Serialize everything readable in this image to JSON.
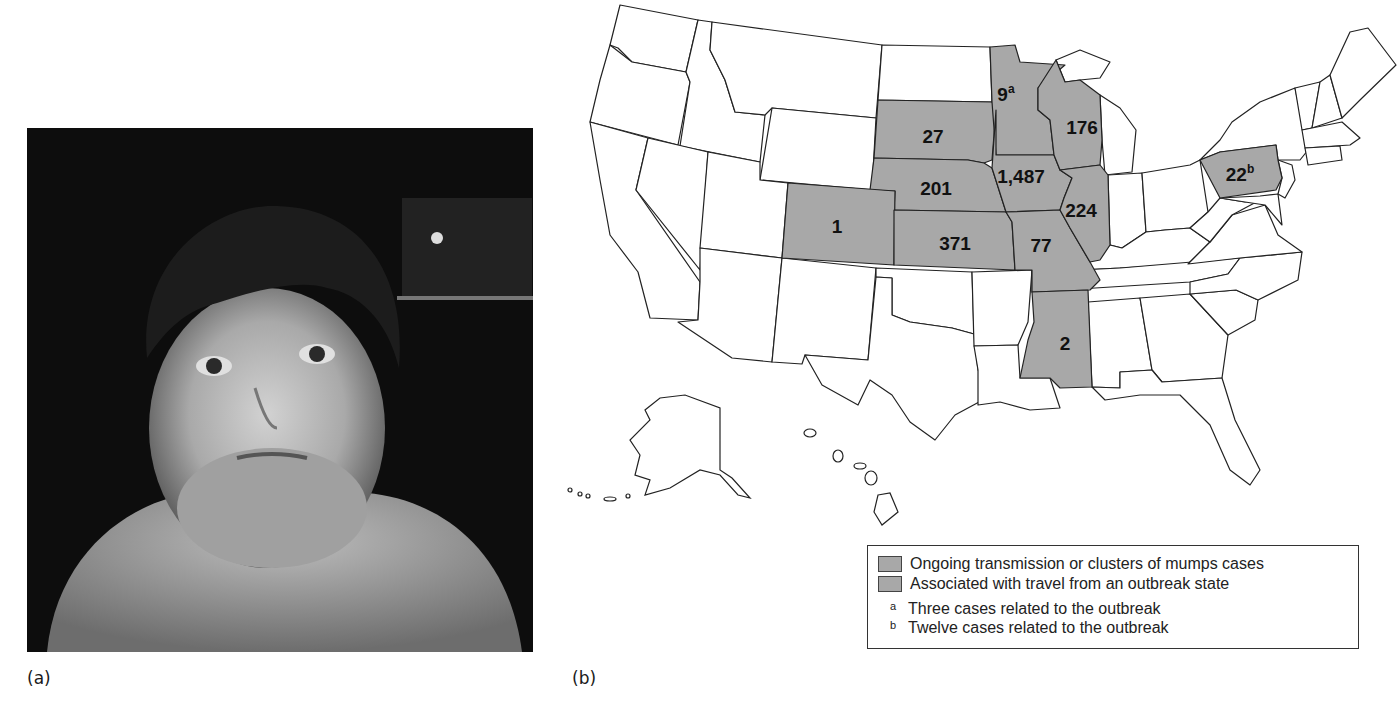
{
  "panels": {
    "a": {
      "label": "(a)",
      "image_desc": "Black-and-white photograph of a young child with swollen jaw/neck (mumps parotitis)"
    },
    "b": {
      "label": "(b)"
    }
  },
  "map": {
    "shade_color": "#a8a8a8",
    "states": [
      {
        "state": "South Dakota",
        "value": "27",
        "sup": ""
      },
      {
        "state": "Minnesota",
        "value": "9",
        "sup": "a"
      },
      {
        "state": "Wisconsin",
        "value": "176",
        "sup": ""
      },
      {
        "state": "Nebraska",
        "value": "201",
        "sup": ""
      },
      {
        "state": "Iowa",
        "value": "1,487",
        "sup": ""
      },
      {
        "state": "Illinois",
        "value": "224",
        "sup": ""
      },
      {
        "state": "Colorado",
        "value": "1",
        "sup": ""
      },
      {
        "state": "Kansas",
        "value": "371",
        "sup": ""
      },
      {
        "state": "Missouri",
        "value": "77",
        "sup": ""
      },
      {
        "state": "Pennsylvania",
        "value": "22",
        "sup": "b"
      },
      {
        "state": "Mississippi",
        "value": "2",
        "sup": ""
      }
    ]
  },
  "legend": {
    "items": [
      {
        "label": "Ongoing transmission or clusters of mumps cases"
      },
      {
        "label": "Associated with travel from an outbreak state"
      }
    ],
    "notes": [
      {
        "mark": "a",
        "text": "Three cases related to the outbreak"
      },
      {
        "mark": "b",
        "text": "Twelve cases related to the outbreak"
      }
    ]
  }
}
